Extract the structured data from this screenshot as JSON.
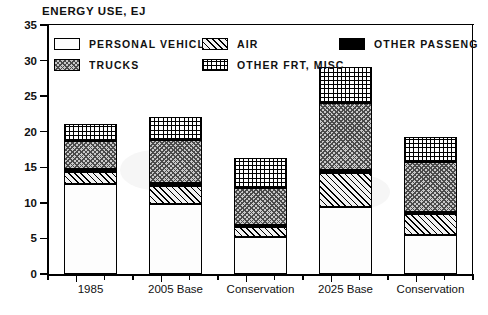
{
  "chart_data": {
    "type": "bar",
    "stacked": true,
    "title": "ENERGY USE, EJ",
    "xlabel": "",
    "ylabel": "ENERGY USE, EJ",
    "ylim": [
      0,
      35
    ],
    "ytick_step": 5,
    "yticks": [
      0,
      5,
      10,
      15,
      20,
      25,
      30,
      35
    ],
    "grid": false,
    "legend_position": "inside-top-left",
    "categories": [
      "1985",
      "2005 Base",
      "Conservation",
      "2025 Base",
      "Conservation"
    ],
    "series": [
      {
        "name": "PERSONAL VEHICLES",
        "key": "personal",
        "values": [
          12.6,
          9.8,
          5.2,
          9.4,
          5.5
        ]
      },
      {
        "name": "AIR",
        "key": "air",
        "values": [
          1.7,
          2.6,
          1.4,
          4.8,
          2.9
        ]
      },
      {
        "name": "OTHER PASSENGER",
        "key": "otherpass",
        "values": [
          0.4,
          0.4,
          0.3,
          0.4,
          0.3
        ]
      },
      {
        "name": "TRUCKS",
        "key": "trucks",
        "values": [
          4.0,
          6.0,
          5.2,
          9.4,
          7.1
        ]
      },
      {
        "name": "OTHER FRT, MISC",
        "key": "misc",
        "values": [
          2.4,
          3.3,
          4.2,
          5.1,
          3.4
        ]
      }
    ],
    "totals": [
      21.1,
      22.1,
      16.3,
      29.1,
      19.2
    ],
    "annotations": []
  },
  "legend": {
    "entries": [
      {
        "label": "PERSONAL VEHICLES",
        "key": "personal",
        "swatch": "white-outline"
      },
      {
        "label": "AIR",
        "key": "air",
        "swatch": "diagonal-hatch"
      },
      {
        "label": "OTHER PASSENGER",
        "key": "otherpass",
        "swatch": "solid-black"
      },
      {
        "label": "TRUCKS",
        "key": "trucks",
        "swatch": "crosshatch-dense"
      },
      {
        "label": "OTHER FRT, MISC",
        "key": "misc",
        "swatch": "grid-dots"
      }
    ]
  },
  "axis": {
    "y_title": "ENERGY USE, EJ",
    "y_labels": [
      "35",
      "30",
      "25",
      "20",
      "15",
      "10",
      "5",
      "0"
    ],
    "x_labels": [
      "1985",
      "2005 Base",
      "Conservation",
      "2025 Base",
      "Conservation"
    ]
  },
  "colors": {
    "ink": "#000000",
    "paper": "#ffffff",
    "trucks_fill": "#c9c9c9",
    "air_fill": "#f2f2f2",
    "personal_fill": "#fdfdfd"
  }
}
